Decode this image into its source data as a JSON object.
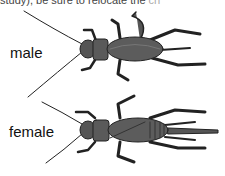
{
  "header": {
    "cut_text": "study), be sure to relocate the",
    "cut_text_faded": " cri"
  },
  "labels": {
    "male": "male",
    "female": "female"
  },
  "colors": {
    "body": "#555555",
    "outline": "#222222",
    "highlight": "#777777"
  }
}
